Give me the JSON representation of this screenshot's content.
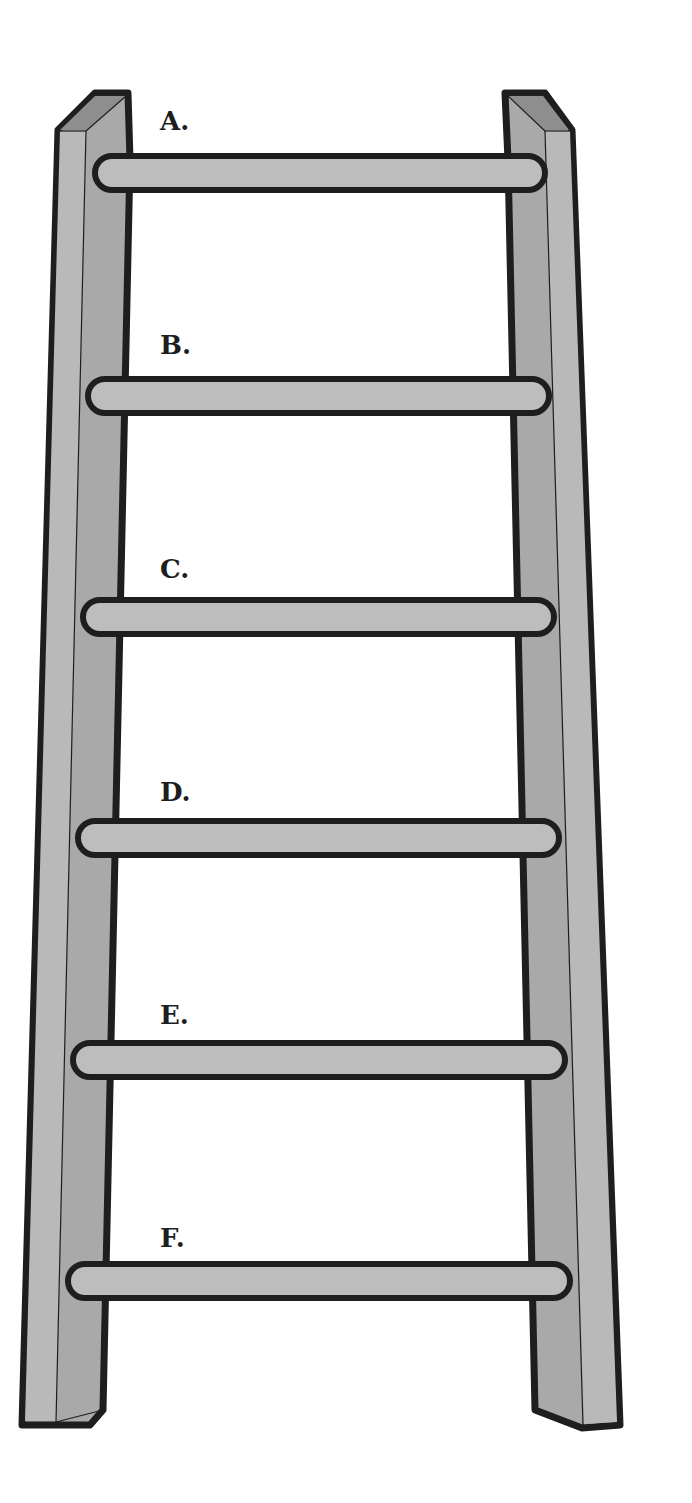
{
  "diagram": {
    "colors": {
      "background": "#ffffff",
      "outline": "#1e1e1e",
      "rail_face": "#a9a9a9",
      "rail_side": "#b9b9b9",
      "rail_top": "#8e8e8e",
      "rung_fill": "#bdbdbd"
    },
    "rungs": [
      {
        "label": "A.",
        "y": 173,
        "x1": 95,
        "x2": 545,
        "label_x": 160,
        "label_y": 108
      },
      {
        "label": "B.",
        "y": 396,
        "x1": 88,
        "x2": 549,
        "label_x": 160,
        "label_y": 332
      },
      {
        "label": "C.",
        "y": 617,
        "x1": 83,
        "x2": 554,
        "label_x": 160,
        "label_y": 556
      },
      {
        "label": "D.",
        "y": 838,
        "x1": 78,
        "x2": 559,
        "label_x": 160,
        "label_y": 779
      },
      {
        "label": "E.",
        "y": 1060,
        "x1": 73,
        "x2": 565,
        "label_x": 160,
        "label_y": 1002
      },
      {
        "label": "F.",
        "y": 1281,
        "x1": 68,
        "x2": 570,
        "label_x": 160,
        "label_y": 1225
      }
    ]
  }
}
